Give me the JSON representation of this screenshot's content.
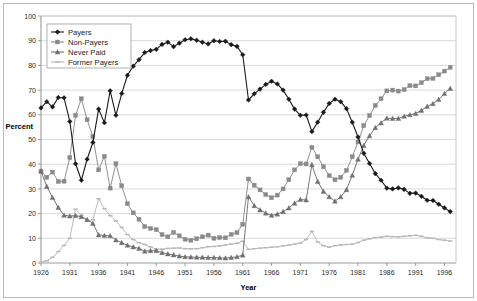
{
  "chart_data": {
    "type": "line",
    "title": "",
    "xlabel": "Year",
    "ylabel": "Percent",
    "xlim": [
      1926,
      1998
    ],
    "ylim": [
      0,
      100
    ],
    "ytick_step": 10,
    "xtick_step": 5,
    "grid": true,
    "grid_axis": "y",
    "legend_position": "top-left",
    "xticks": [
      1926,
      1931,
      1936,
      1941,
      1946,
      1951,
      1956,
      1961,
      1966,
      1971,
      1976,
      1981,
      1986,
      1991,
      1996
    ],
    "yticks": [
      0,
      10,
      20,
      30,
      40,
      50,
      60,
      70,
      80,
      90,
      100
    ],
    "x": [
      1926,
      1927,
      1928,
      1929,
      1930,
      1931,
      1932,
      1933,
      1934,
      1935,
      1936,
      1937,
      1938,
      1939,
      1940,
      1941,
      1942,
      1943,
      1944,
      1945,
      1946,
      1947,
      1948,
      1949,
      1950,
      1951,
      1952,
      1953,
      1954,
      1955,
      1956,
      1957,
      1958,
      1959,
      1960,
      1961,
      1962,
      1963,
      1964,
      1965,
      1966,
      1967,
      1968,
      1969,
      1970,
      1971,
      1972,
      1973,
      1974,
      1975,
      1976,
      1977,
      1978,
      1979,
      1980,
      1981,
      1982,
      1983,
      1984,
      1985,
      1986,
      1987,
      1988,
      1989,
      1990,
      1991,
      1992,
      1993,
      1994,
      1995,
      1996,
      1997
    ],
    "series": [
      {
        "name": "Payers",
        "marker": "diamond",
        "color": "#1a1a1a",
        "values": [
          62.8,
          65.3,
          63.2,
          67.0,
          66.9,
          57.3,
          40.2,
          33.5,
          42.0,
          48.8,
          62.3,
          56.8,
          69.7,
          59.8,
          68.6,
          76.0,
          79.7,
          82.3,
          85.2,
          86.0,
          86.5,
          88.5,
          89.4,
          87.6,
          89.0,
          90.4,
          90.8,
          90.2,
          89.4,
          88.7,
          90.0,
          89.7,
          89.8,
          88.4,
          87.7,
          84.3,
          66.0,
          68.5,
          70.4,
          72.3,
          73.6,
          72.5,
          70.0,
          66.3,
          62.3,
          59.8,
          59.9,
          53.2,
          57.0,
          61.0,
          64.6,
          66.3,
          65.3,
          62.5,
          57.0,
          51.0,
          44.4,
          40.3,
          36.2,
          33.5,
          30.3,
          30.0,
          30.4,
          29.8,
          28.2,
          28.3,
          27.0,
          25.4,
          25.3,
          23.8,
          22.3,
          20.8
        ]
      },
      {
        "name": "Non-Payers",
        "marker": "square",
        "color": "#8a8a8a",
        "values": [
          37.2,
          34.7,
          36.8,
          33.0,
          33.1,
          42.7,
          59.8,
          66.5,
          58.0,
          51.2,
          37.7,
          43.2,
          30.3,
          40.2,
          31.3,
          24.0,
          20.3,
          17.7,
          14.8,
          14.0,
          13.5,
          11.5,
          10.6,
          12.4,
          11.0,
          9.6,
          9.2,
          9.8,
          10.6,
          11.3,
          10.0,
          10.3,
          10.2,
          11.6,
          12.3,
          15.7,
          34.0,
          31.5,
          29.6,
          27.7,
          26.4,
          27.5,
          30.0,
          33.7,
          37.7,
          40.2,
          40.1,
          46.8,
          43.0,
          39.0,
          35.4,
          33.7,
          34.7,
          37.5,
          43.0,
          49.0,
          55.6,
          59.7,
          63.8,
          66.5,
          69.7,
          70.0,
          69.6,
          70.2,
          71.8,
          71.7,
          73.0,
          74.6,
          74.7,
          76.2,
          77.7,
          79.2
        ]
      },
      {
        "name": "Never Paid",
        "marker": "triangle",
        "color": "#707070",
        "values": [
          37.2,
          31.0,
          26.5,
          22.5,
          19.3,
          19.0,
          19.2,
          18.7,
          17.6,
          16.0,
          11.4,
          11.1,
          11.0,
          9.3,
          8.2,
          7.2,
          6.5,
          5.9,
          4.8,
          5.0,
          5.0,
          4.2,
          3.7,
          3.3,
          2.8,
          2.5,
          2.4,
          2.3,
          2.3,
          2.2,
          2.2,
          2.1,
          2.0,
          2.2,
          2.5,
          3.2,
          26.8,
          23.2,
          21.5,
          20.2,
          19.3,
          19.8,
          20.8,
          22.3,
          24.2,
          25.7,
          25.5,
          39.8,
          33.0,
          29.0,
          26.8,
          25.0,
          26.8,
          29.7,
          35.5,
          42.0,
          47.6,
          51.5,
          54.8,
          56.7,
          58.6,
          58.5,
          58.5,
          59.4,
          60.0,
          60.5,
          61.8,
          63.4,
          64.5,
          66.2,
          68.6,
          70.7
        ]
      },
      {
        "name": "Former Payers",
        "marker": "dash",
        "color": "#b8b8b8",
        "values": [
          0.3,
          0.9,
          2.3,
          4.6,
          7.1,
          10.0,
          21.8,
          19.3,
          17.0,
          17.5,
          26.0,
          22.0,
          19.2,
          17.0,
          14.4,
          11.5,
          9.5,
          8.2,
          7.5,
          6.5,
          5.6,
          5.6,
          5.9,
          6.0,
          6.1,
          5.8,
          5.7,
          5.8,
          6.2,
          6.6,
          6.7,
          6.9,
          7.3,
          7.7,
          8.0,
          8.8,
          5.5,
          5.8,
          6.0,
          6.2,
          6.4,
          6.6,
          6.9,
          7.2,
          7.6,
          8.1,
          9.5,
          12.8,
          8.5,
          7.0,
          6.4,
          7.0,
          7.3,
          7.5,
          7.6,
          8.3,
          9.2,
          9.8,
          10.3,
          10.5,
          10.8,
          10.7,
          10.6,
          10.8,
          11.0,
          11.2,
          10.8,
          10.2,
          10.0,
          9.5,
          9.2,
          8.9
        ]
      }
    ]
  },
  "axis": {
    "x_title": "Year",
    "y_title": "Percent"
  },
  "legend": {
    "items": [
      {
        "label": "Payers"
      },
      {
        "label": "Non-Payers"
      },
      {
        "label": "Never Paid"
      },
      {
        "label": "Former Payers"
      }
    ]
  }
}
